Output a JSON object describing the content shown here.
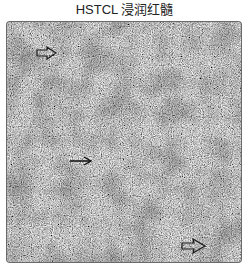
{
  "figure": {
    "title": "HSTCL 浸润红髓",
    "image_description": "Grayscale micrograph of spleen tissue showing diffuse red pulp infiltration",
    "annotations": [
      {
        "type": "outlined-arrow",
        "direction": "right",
        "position": "upper-left"
      },
      {
        "type": "line-arrow",
        "direction": "right",
        "position": "center-left"
      },
      {
        "type": "outlined-arrow",
        "direction": "right",
        "position": "lower-right"
      }
    ]
  }
}
